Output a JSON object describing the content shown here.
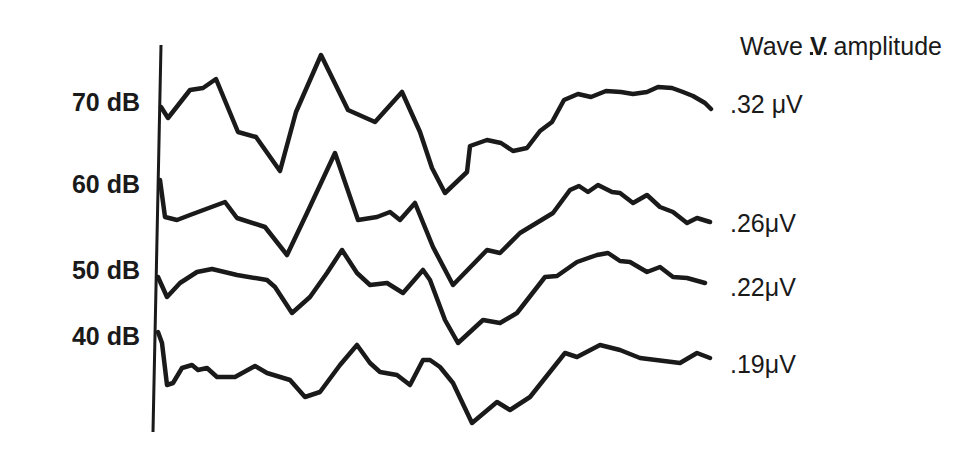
{
  "chart_data": {
    "type": "line",
    "title": "Wave V amplitude",
    "xlabel": "",
    "ylabel": "",
    "grid": false,
    "legend_position": "none",
    "series": [
      {
        "name": "70 dB",
        "amplitude_label": ".32 μV",
        "amplitude_uV": 0.32,
        "points": [
          [
            161,
            107
          ],
          [
            168,
            118
          ],
          [
            190,
            90
          ],
          [
            203,
            88
          ],
          [
            216,
            79
          ],
          [
            238,
            132
          ],
          [
            256,
            137
          ],
          [
            280,
            171
          ],
          [
            296,
            112
          ],
          [
            321,
            55
          ],
          [
            348,
            110
          ],
          [
            375,
            122
          ],
          [
            402,
            92
          ],
          [
            420,
            132
          ],
          [
            432,
            168
          ],
          [
            445,
            193
          ],
          [
            467,
            172
          ],
          [
            470,
            146
          ],
          [
            487,
            140
          ],
          [
            501,
            143
          ],
          [
            513,
            151
          ],
          [
            527,
            148
          ],
          [
            540,
            131
          ],
          [
            552,
            122
          ],
          [
            564,
            100
          ],
          [
            578,
            94
          ],
          [
            591,
            97
          ],
          [
            606,
            91
          ],
          [
            621,
            92
          ],
          [
            633,
            94
          ],
          [
            647,
            92
          ],
          [
            658,
            87
          ],
          [
            672,
            88
          ],
          [
            683,
            92
          ],
          [
            693,
            96
          ],
          [
            705,
            103
          ],
          [
            711,
            109
          ]
        ]
      },
      {
        "name": "60 dB",
        "amplitude_label": ".26μV",
        "amplitude_uV": 0.26,
        "points": [
          [
            160,
            180
          ],
          [
            165,
            217
          ],
          [
            177,
            220
          ],
          [
            190,
            215
          ],
          [
            225,
            202
          ],
          [
            237,
            218
          ],
          [
            265,
            227
          ],
          [
            287,
            255
          ],
          [
            307,
            213
          ],
          [
            335,
            153
          ],
          [
            358,
            220
          ],
          [
            377,
            217
          ],
          [
            390,
            212
          ],
          [
            400,
            220
          ],
          [
            415,
            203
          ],
          [
            433,
            247
          ],
          [
            453,
            285
          ],
          [
            487,
            250
          ],
          [
            500,
            253
          ],
          [
            520,
            233
          ],
          [
            553,
            213
          ],
          [
            570,
            190
          ],
          [
            579,
            186
          ],
          [
            588,
            192
          ],
          [
            598,
            185
          ],
          [
            612,
            192
          ],
          [
            620,
            193
          ],
          [
            633,
            203
          ],
          [
            647,
            195
          ],
          [
            660,
            207
          ],
          [
            673,
            212
          ],
          [
            687,
            223
          ],
          [
            697,
            218
          ],
          [
            710,
            222
          ]
        ]
      },
      {
        "name": "50 dB",
        "amplitude_label": ".22μV",
        "amplitude_uV": 0.22,
        "points": [
          [
            158,
            277
          ],
          [
            167,
            297
          ],
          [
            180,
            283
          ],
          [
            197,
            272
          ],
          [
            212,
            269
          ],
          [
            237,
            275
          ],
          [
            267,
            280
          ],
          [
            275,
            287
          ],
          [
            292,
            313
          ],
          [
            310,
            297
          ],
          [
            327,
            273
          ],
          [
            342,
            250
          ],
          [
            357,
            273
          ],
          [
            370,
            285
          ],
          [
            387,
            283
          ],
          [
            403,
            293
          ],
          [
            423,
            270
          ],
          [
            430,
            280
          ],
          [
            445,
            320
          ],
          [
            458,
            343
          ],
          [
            483,
            320
          ],
          [
            500,
            323
          ],
          [
            517,
            313
          ],
          [
            545,
            277
          ],
          [
            557,
            276
          ],
          [
            577,
            262
          ],
          [
            597,
            255
          ],
          [
            608,
            253
          ],
          [
            620,
            261
          ],
          [
            630,
            262
          ],
          [
            647,
            272
          ],
          [
            660,
            267
          ],
          [
            673,
            277
          ],
          [
            687,
            278
          ],
          [
            705,
            283
          ]
        ]
      },
      {
        "name": "40 dB",
        "amplitude_label": ".19μV",
        "amplitude_uV": 0.19,
        "points": [
          [
            158,
            332
          ],
          [
            162,
            343
          ],
          [
            167,
            385
          ],
          [
            173,
            383
          ],
          [
            182,
            368
          ],
          [
            192,
            365
          ],
          [
            198,
            370
          ],
          [
            207,
            368
          ],
          [
            217,
            377
          ],
          [
            235,
            377
          ],
          [
            255,
            366
          ],
          [
            267,
            373
          ],
          [
            290,
            380
          ],
          [
            305,
            397
          ],
          [
            320,
            392
          ],
          [
            340,
            365
          ],
          [
            357,
            345
          ],
          [
            370,
            363
          ],
          [
            380,
            372
          ],
          [
            397,
            375
          ],
          [
            410,
            385
          ],
          [
            423,
            360
          ],
          [
            430,
            360
          ],
          [
            440,
            367
          ],
          [
            453,
            383
          ],
          [
            472,
            423
          ],
          [
            497,
            402
          ],
          [
            510,
            410
          ],
          [
            530,
            397
          ],
          [
            565,
            353
          ],
          [
            577,
            357
          ],
          [
            600,
            345
          ],
          [
            620,
            350
          ],
          [
            640,
            358
          ],
          [
            680,
            363
          ],
          [
            697,
            353
          ],
          [
            710,
            358
          ]
        ]
      }
    ],
    "axis": {
      "x1": 161,
      "y1": 45,
      "x2": 153,
      "y2": 432
    },
    "note": "points are pixel coordinates of traced waveforms (no numeric axes shown)"
  },
  "labels": {
    "title_prefix": "Wave ",
    "title_roman": "V",
    "title_suffix": " amplitude",
    "levels": [
      "70 dB",
      "60 dB",
      "50 dB",
      "40 dB"
    ],
    "amplitudes": [
      ".32 μV",
      ".26μV",
      ".22μV",
      ".19μV"
    ]
  }
}
